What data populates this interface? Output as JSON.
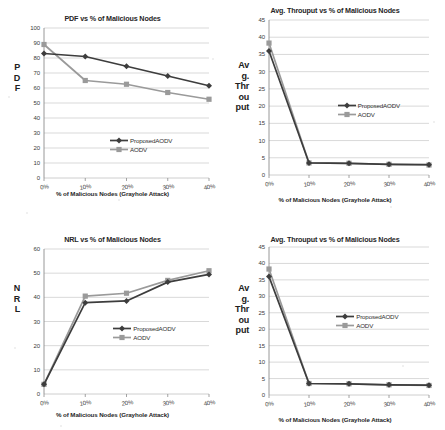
{
  "page": {
    "background": "#ffffff",
    "series_colors": {
      "proposed": "#3d3d3d",
      "aodv": "#9a9a9a"
    },
    "grid_color": "#c8c8c8",
    "axis_color": "#8c8c8c"
  },
  "legend": {
    "proposed_label": "ProposedAODV",
    "aodv_label": "AODV"
  },
  "figures": [
    {
      "id": "pdf-chart",
      "title": "PDF vs % of Malicious Nodes",
      "ylabel_lines": [
        "P",
        "D",
        "F"
      ],
      "xlabel": "% of Malicious Nodes (Grayhole Attack)"
    },
    {
      "id": "throughput-chart-top",
      "title": "Avg. Throuput vs % of Malicious Nodes",
      "ylabel_lines": [
        "Av",
        "g.",
        "Thr",
        "ou",
        "put"
      ],
      "xlabel": "% of Malicious Nodes (Grayhole Attack)"
    },
    {
      "id": "nrl-chart",
      "title": "NRL vs % of Malicious Nodes",
      "ylabel_lines": [
        "N",
        "R",
        "L"
      ],
      "xlabel": "% of Malicious Nodes (Grayhole Attack)"
    },
    {
      "id": "throughput-chart-bottom",
      "title": "Avg. Throuput vs % of Malicious Nodes",
      "ylabel_lines": [
        "Av",
        "g.",
        "Thr",
        "ou",
        "put"
      ],
      "xlabel": "% of Malicious Nodes (Grayhole Attack)"
    }
  ],
  "chart_data": [
    {
      "type": "line",
      "id": "pdf-chart",
      "title": "PDF vs % of Malicious Nodes",
      "xlabel": "% of Malicious Nodes (Grayhole Attack)",
      "ylabel": "PDF",
      "categories": [
        "0%",
        "10%",
        "20%",
        "30%",
        "40%"
      ],
      "x": [
        0,
        10,
        20,
        30,
        40
      ],
      "ylim": [
        0,
        100
      ],
      "ytick_values": [
        0,
        10,
        20,
        30,
        40,
        50,
        60,
        70,
        80,
        90,
        100
      ],
      "grid": true,
      "legend_position": "inside-bottom-right",
      "series": [
        {
          "name": "ProposedAODV",
          "values": [
            83,
            81,
            74.5,
            68,
            61.5
          ],
          "color": "#3d3d3d",
          "marker": "diamond"
        },
        {
          "name": "AODV",
          "values": [
            89,
            65,
            62.5,
            57,
            52.5
          ],
          "color": "#9a9a9a",
          "marker": "square"
        }
      ]
    },
    {
      "type": "line",
      "id": "throughput-chart-top",
      "title": "Avg. Throuput vs % of Malicious Nodes",
      "xlabel": "% of Malicious Nodes (Grayhole Attack)",
      "ylabel": "Avg. Throuput",
      "categories": [
        "0%",
        "10%",
        "20%",
        "30%",
        "40%"
      ],
      "x": [
        0,
        10,
        20,
        30,
        40
      ],
      "ylim": [
        0,
        45
      ],
      "ytick_values": [
        0,
        5,
        10,
        15,
        20,
        25,
        30,
        35,
        40,
        45
      ],
      "grid": true,
      "legend_position": "inside-middle-right",
      "series": [
        {
          "name": "ProposedAODV",
          "values": [
            36,
            3.5,
            3.4,
            3.1,
            3.0
          ],
          "color": "#3d3d3d",
          "marker": "diamond"
        },
        {
          "name": "AODV",
          "values": [
            38.3,
            3.5,
            3.4,
            3.1,
            2.9
          ],
          "color": "#9a9a9a",
          "marker": "square"
        }
      ]
    },
    {
      "type": "line",
      "id": "nrl-chart",
      "title": "NRL vs % of Malicious Nodes",
      "xlabel": "% of Malicious Nodes (Grayhole Attack)",
      "ylabel": "NRL",
      "categories": [
        "0%",
        "10%",
        "20%",
        "30%",
        "40%"
      ],
      "x": [
        0,
        10,
        20,
        30,
        40
      ],
      "ylim": [
        0,
        60
      ],
      "ytick_values": [
        0,
        10,
        20,
        30,
        40,
        50,
        60
      ],
      "grid": true,
      "legend_position": "inside-middle-right",
      "series": [
        {
          "name": "ProposedAODV",
          "values": [
            4,
            37.8,
            38.5,
            46.3,
            49.5
          ],
          "color": "#3d3d3d",
          "marker": "diamond"
        },
        {
          "name": "AODV",
          "values": [
            4,
            40.5,
            41.7,
            47,
            51
          ],
          "color": "#9a9a9a",
          "marker": "square"
        }
      ]
    },
    {
      "type": "line",
      "id": "throughput-chart-bottom",
      "title": "Avg. Throuput vs % of Malicious Nodes",
      "xlabel": "% of Malicious Nodes (Grayhole Attack)",
      "ylabel": "Avg. Throuput",
      "categories": [
        "0%",
        "10%",
        "20%",
        "30%",
        "40%"
      ],
      "x": [
        0,
        10,
        20,
        30,
        40
      ],
      "ylim": [
        0,
        45
      ],
      "ytick_values": [
        0,
        5,
        10,
        15,
        20,
        25,
        30,
        35,
        40,
        45
      ],
      "grid": true,
      "legend_position": "inside-middle-right",
      "series": [
        {
          "name": "ProposedAODV",
          "values": [
            36,
            3.5,
            3.4,
            3.1,
            3.0
          ],
          "color": "#3d3d3d",
          "marker": "diamond"
        },
        {
          "name": "AODV",
          "values": [
            38.3,
            3.5,
            3.4,
            3.1,
            2.9
          ],
          "color": "#9a9a9a",
          "marker": "square"
        }
      ]
    }
  ]
}
